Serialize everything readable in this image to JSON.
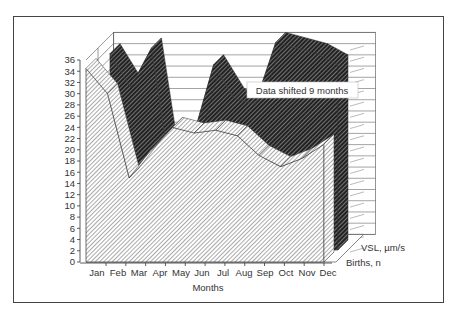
{
  "chart_data": {
    "type": "area",
    "style": "3d-area",
    "title": "",
    "xlabel": "Months",
    "ylabel": "",
    "categories": [
      "Jan",
      "Feb",
      "Mar",
      "Apr",
      "May",
      "Jun",
      "Jul",
      "Aug",
      "Sep",
      "Oct",
      "Nov",
      "Dec"
    ],
    "yticks": [
      0,
      2,
      4,
      6,
      8,
      10,
      12,
      14,
      16,
      18,
      20,
      22,
      24,
      26,
      28,
      30,
      32,
      34,
      36
    ],
    "ylim": [
      0,
      36
    ],
    "grid": true,
    "series": [
      {
        "name": "Births, n",
        "values": [
          34.5,
          30,
          15,
          20,
          24,
          23,
          23.5,
          22.5,
          19,
          17,
          18.5,
          21
        ],
        "fill": "light-hatch",
        "depth": "front"
      },
      {
        "name": "VSL, µm/s",
        "values": [
          35,
          29,
          36,
          12,
          20,
          33,
          27,
          26,
          37,
          36,
          35,
          33
        ],
        "fill": "dark-hatch",
        "depth": "back"
      }
    ],
    "legend_position": "depth-axis-right",
    "annotations": [
      "Data shifted 9 months"
    ]
  },
  "axis": {
    "x_title": "Months",
    "months": [
      "Jan",
      "Feb",
      "Mar",
      "Apr",
      "May",
      "Jun",
      "Jul",
      "Aug",
      "Sep",
      "Oct",
      "Nov",
      "Dec"
    ],
    "y_ticks": [
      "0",
      "2",
      "4",
      "6",
      "8",
      "10",
      "12",
      "14",
      "16",
      "18",
      "20",
      "22",
      "24",
      "26",
      "28",
      "30",
      "32",
      "34",
      "36"
    ]
  },
  "legend": {
    "vsl": "VSL, µm/s",
    "births": "Births, n"
  },
  "annotation": {
    "text": "Data shifted 9 months"
  }
}
